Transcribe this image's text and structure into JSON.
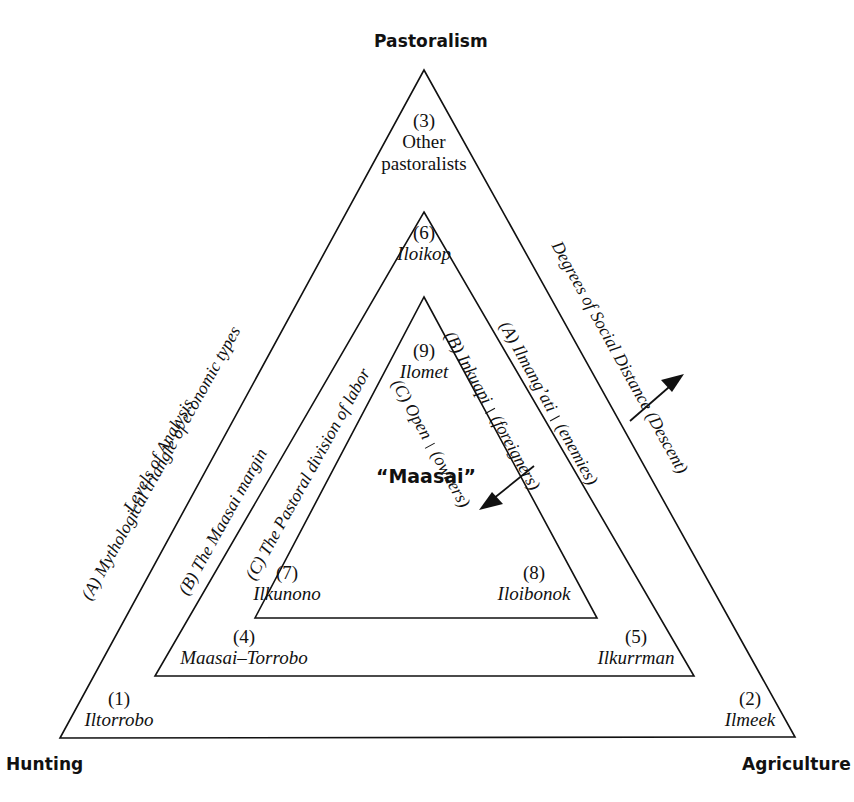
{
  "figure": {
    "corners": {
      "top": "Pastoralism",
      "bottom_left": "Hunting",
      "bottom_right": "Agriculture"
    },
    "center_label": "“Maasai”",
    "zones": [
      {
        "id": "zone-3",
        "number": "(3)",
        "name_line1": "Other",
        "name_line2": "pastoralists"
      },
      {
        "id": "zone-6",
        "number": "(6)",
        "name": "Iloikop"
      },
      {
        "id": "zone-9",
        "number": "(9)",
        "name": "Ilomet"
      },
      {
        "id": "zone-7",
        "number": "(7)",
        "name": "Ilkunono"
      },
      {
        "id": "zone-8",
        "number": "(8)",
        "name": "Iloibonok"
      },
      {
        "id": "zone-4",
        "number": "(4)",
        "name": "Maasai–Torrobo"
      },
      {
        "id": "zone-5",
        "number": "(5)",
        "name": "Ilkurrman"
      },
      {
        "id": "zone-1",
        "number": "(1)",
        "name": "Iltorrobo"
      },
      {
        "id": "zone-2",
        "number": "(2)",
        "name": "Ilmeek"
      }
    ],
    "left_axis": {
      "heading": "Levels of Analysis",
      "levels": [
        "(A) Mythological triangle of economic types",
        "(B) The Maasai margin",
        "(C) The Pastoral division of labor"
      ]
    },
    "right_axis": {
      "heading": "Degrees of Social Distance (Descent)",
      "levels": [
        {
          "prefix": "(A)  Ilmang’ati",
          "suffix": "(enemies)"
        },
        {
          "prefix": "(B)  Inkuapi",
          "suffix": "(foreigners)"
        },
        {
          "prefix": "(C)  Open",
          "suffix": "(owners)"
        }
      ]
    },
    "colors": {
      "ink": "#111111",
      "paper": "#ffffff"
    }
  }
}
